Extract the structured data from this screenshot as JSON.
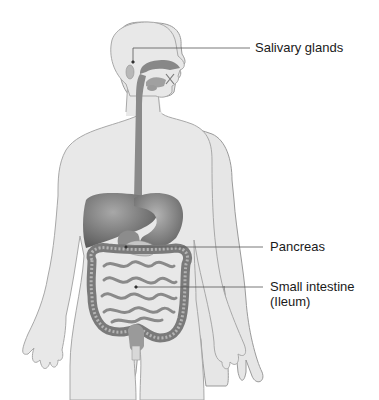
{
  "figure": {
    "colors": {
      "body_fill": "#e6e6e6",
      "body_stroke": "#9a9a9a",
      "organ_dark": "#6e6e6e",
      "organ_mid": "#8c8c8c",
      "organ_light": "#b0b0b0",
      "leader_line": "#555555"
    }
  },
  "labels": {
    "salivary": "Salivary glands",
    "pancreas": "Pancreas",
    "small_intestine_line1": "Small intestine",
    "small_intestine_line2": "(Ileum)"
  }
}
